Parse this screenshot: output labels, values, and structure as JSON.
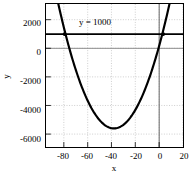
{
  "chart_data": {
    "type": "line",
    "title": "",
    "xlabel": "x",
    "ylabel": "y",
    "xlim": [
      -95,
      20
    ],
    "ylim": [
      -6900,
      3100
    ],
    "grid": true,
    "legend": false,
    "xticks": [
      -80,
      -60,
      -40,
      -20,
      0,
      20
    ],
    "xtick_labels": [
      "-80",
      "-60",
      "-40",
      "-20",
      "0",
      "20"
    ],
    "yticks": [
      2000,
      0,
      -2000,
      -4000,
      -6000
    ],
    "ytick_labels": [
      "2000",
      "0",
      "-2000",
      "-4000",
      "-6000"
    ],
    "annotations": [
      {
        "text": "y = 1000",
        "x": -40,
        "y": 1900
      }
    ],
    "series": [
      {
        "name": "parabola",
        "type": "line",
        "color": "#000000",
        "width": 2.2,
        "equation": "y = 4*(x+38)^2 - 5600",
        "vertex": [
          -38,
          -5600
        ],
        "points_x": [
          -95,
          -90,
          -85,
          -80,
          -75,
          -70,
          -65,
          -60,
          -55,
          -50,
          -45,
          -40,
          -35,
          -30,
          -25,
          -20,
          -15,
          -10,
          -5,
          0,
          5,
          10,
          15,
          20
        ],
        "points_y": [
          7396,
          5216,
          3436,
          2056,
          1076,
          496,
          316,
          536,
          1156,
          2176,
          3596,
          5416,
          7636,
          10256,
          13276,
          16696,
          20516,
          24736,
          29356,
          34376,
          39796,
          45616,
          51836,
          58456
        ]
      },
      {
        "name": "horizontal-line",
        "type": "hline",
        "color": "#000000",
        "width": 1.8,
        "y": 1000
      },
      {
        "name": "zero-line",
        "type": "hline",
        "color": "#808080",
        "width": 1,
        "y": 0
      },
      {
        "name": "vertical-zero-line",
        "type": "vline",
        "color": "#606060",
        "width": 1,
        "x": 0
      }
    ],
    "markers": [
      {
        "name": "left-intersection",
        "x": -79.4,
        "y": 1000
      },
      {
        "name": "right-intersection",
        "x": 3.4,
        "y": 1000
      }
    ]
  }
}
